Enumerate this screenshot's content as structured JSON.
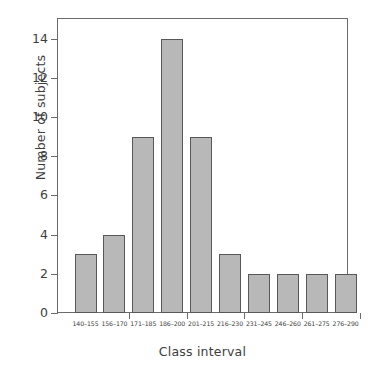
{
  "chart_data": {
    "type": "bar",
    "title": "",
    "xlabel": "Class interval",
    "ylabel": "Number of subjects",
    "categories": [
      "140-155",
      "156-170",
      "171-185",
      "186-200",
      "201-215",
      "216-230",
      "231-245",
      "246-260",
      "261-275",
      "276-290"
    ],
    "values": [
      3,
      4,
      9,
      14,
      9,
      3,
      2,
      2,
      2,
      2
    ],
    "ylim": [
      0,
      15
    ],
    "ytick_labels": [
      "0",
      "2",
      "4",
      "6",
      "8",
      "10",
      "12",
      "14"
    ],
    "ytick_values": [
      0,
      2,
      4,
      6,
      8,
      10,
      12,
      14
    ],
    "grid": false,
    "legend": false,
    "bar_fill_color": "#b8b8b8",
    "bar_edge_color": "#585858",
    "axis_color": "#6b6b6b",
    "text_color": "#3d3d3d",
    "background_color": "#ffffff"
  }
}
